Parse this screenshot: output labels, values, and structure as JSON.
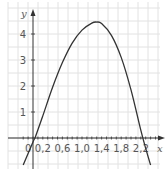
{
  "chart_data": {
    "type": "line",
    "title": "",
    "xlabel": "x",
    "ylabel": "y",
    "xlim": [
      -0.25,
      2.6
    ],
    "ylim": [
      -1.1,
      4.8
    ],
    "grid": true,
    "legend": null,
    "x_ticks": [
      "0",
      "0,2",
      "0,6",
      "1,0",
      "1,4",
      "1,8",
      "2,2"
    ],
    "x_tick_values": [
      0,
      0.2,
      0.6,
      1.0,
      1.4,
      1.8,
      2.2
    ],
    "y_ticks": [
      "1",
      "2",
      "3",
      "4"
    ],
    "y_tick_values": [
      1,
      2,
      3,
      4
    ],
    "series": [
      {
        "name": "f(x)",
        "color": "#333333",
        "x": [
          -0.2,
          0.0,
          0.05,
          0.2,
          0.4,
          0.6,
          0.8,
          1.0,
          1.2,
          1.3,
          1.4,
          1.6,
          1.8,
          2.0,
          2.2,
          2.3,
          2.4
        ],
        "y": [
          -1.04,
          -0.15,
          0.05,
          0.85,
          1.95,
          2.9,
          3.65,
          4.15,
          4.42,
          4.46,
          4.4,
          3.95,
          3.1,
          1.85,
          0.3,
          -0.4,
          -1.04
        ]
      }
    ]
  },
  "labels": {
    "x_axis": "x",
    "y_axis": "y",
    "origin": "0"
  },
  "colors": {
    "grid": "#e2e2e2",
    "axis": "#333333",
    "curve": "#333333",
    "text": "#555555"
  }
}
